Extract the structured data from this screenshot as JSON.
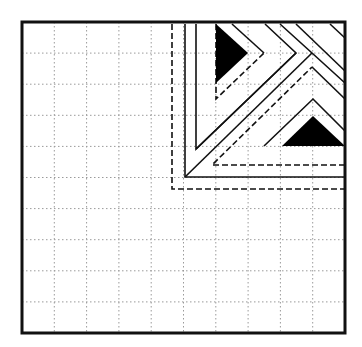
{
  "diagram": {
    "type": "quilt-block-pattern",
    "grid": {
      "rows": 10,
      "cols": 10,
      "line_style": "dotted",
      "color": "#9a9a9a"
    },
    "frame": {
      "x": 22,
      "y": 22,
      "width": 323,
      "height": 311,
      "stroke": "#111111",
      "stroke_width": 3
    },
    "colors": {
      "ink": "#111111",
      "fill": "#000000",
      "background": "#ffffff",
      "grid": "#9a9a9a"
    },
    "shapes": {
      "triangles": [
        {
          "name": "upper-left-triangle",
          "points": "216,24 248,53 216,83"
        },
        {
          "name": "lower-right-triangle",
          "points": "282,146 313,116 345,146"
        }
      ],
      "dashed_lines": [
        {
          "name": "outer-dashed-L",
          "points": "172,24 172,189 345,189"
        },
        {
          "name": "inner-dashed-vertical",
          "points": "216,24 216,99 264,53"
        },
        {
          "name": "inner-dashed-horizontal",
          "points": "345,165 212,165 312,67"
        }
      ],
      "solid_lines": [
        {
          "name": "solid-L",
          "points": "185,24 185,177 345,177"
        },
        {
          "name": "inner-solid-vertical",
          "points": "196,24 196,149 296,53 265,24"
        },
        {
          "name": "diagonal-main",
          "points": "185,177 312,53"
        },
        {
          "name": "lower-chevron-outer",
          "points": "264,146 313,99 345,131"
        },
        {
          "name": "lower-chevron-inner",
          "points": "312,67 345,99"
        },
        {
          "name": "upper-chevron-1",
          "points": "232,24 264,53"
        },
        {
          "name": "upper-chevron-2",
          "points": "280,24 312,53 345,83"
        },
        {
          "name": "upper-chevron-3",
          "points": "296,24 345,71"
        },
        {
          "name": "upper-chevron-4",
          "points": "330,24 345,38"
        },
        {
          "name": "middle-diagonal",
          "points": "196,149 296,53"
        }
      ]
    }
  }
}
